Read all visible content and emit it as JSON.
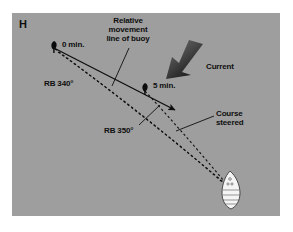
{
  "figure": {
    "panel_letter": "H",
    "background_color": "#9e9e9e",
    "outer_color": "#ffffff",
    "ink_color": "#0e0e0e",
    "vessel_color": "#f2f2f2"
  },
  "labels": {
    "relative_movement": "Relative\nmovement\nline of buoy",
    "buoy_zero": "0 min.",
    "buoy_five": "5 min.",
    "bearing_first": "RB 340°",
    "bearing_second": "RB 350°",
    "current": "Current",
    "course_steered": "Course\nsteered"
  },
  "diagram": {
    "buoy_positions": [
      {
        "name": "0 min.",
        "x": 54,
        "y": 47
      },
      {
        "name": "5 min.",
        "x": 144,
        "y": 89
      }
    ],
    "vessel": {
      "x": 232,
      "y": 196,
      "heading_deg": 335
    },
    "relative_movement_line": {
      "from": [
        52,
        48
      ],
      "to": [
        177,
        111
      ],
      "style": "solid",
      "arrow": true
    },
    "bearing_lines": [
      {
        "label": "RB 340°",
        "from": [
          54,
          48
        ],
        "to": [
          228,
          186
        ],
        "style": "dashed"
      },
      {
        "label": "RB 350°",
        "from": [
          144,
          90
        ],
        "to": [
          228,
          186
        ],
        "style": "dashed"
      }
    ],
    "course_steered_line": {
      "from": [
        60,
        52
      ],
      "to": [
        228,
        188
      ],
      "style": "dashed"
    },
    "current_arrow": {
      "tip": [
        168,
        76
      ],
      "tail": [
        196,
        42
      ],
      "direction": "down-left"
    },
    "leaders": [
      {
        "name": "relative-movement-leader",
        "from": [
          128,
          49
        ],
        "to": [
          113,
          86
        ]
      },
      {
        "name": "course-steered-leader",
        "from": [
          214,
          117
        ],
        "to": [
          176,
          131
        ]
      }
    ]
  }
}
